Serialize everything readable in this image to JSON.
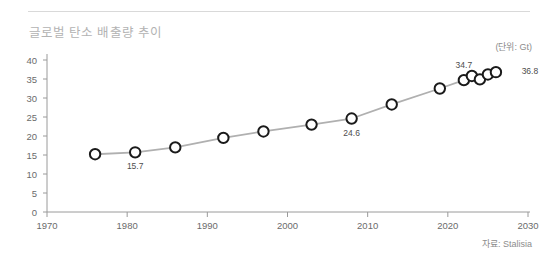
{
  "card": {
    "title": "글로벌 탄소 배출량 추이",
    "unit": "(단위: Gt)",
    "source": "자료: Stalisia"
  },
  "chart_data": {
    "type": "line",
    "title": "글로벌 탄소 배출량 추이",
    "subtitle": "",
    "xlabel": "",
    "ylabel": "",
    "unit": "(단위: Gt)",
    "source": "자료: Stalisia",
    "xlim": [
      1970,
      2030
    ],
    "ylim": [
      0,
      40
    ],
    "xticks": [
      1970,
      1980,
      1990,
      2000,
      2010,
      2020,
      2030
    ],
    "xtick_labels": [
      "1970",
      "1980",
      "1990",
      "2000",
      "2010",
      "2020",
      "2030"
    ],
    "yticks": [
      0,
      5,
      10,
      15,
      20,
      25,
      30,
      35,
      40
    ],
    "ytick_labels": [
      "0",
      "5",
      "10",
      "15",
      "20",
      "25",
      "30",
      "35",
      "40"
    ],
    "grid": false,
    "legend": false,
    "marker": "open-circle",
    "line_color": "#b0b0b0",
    "marker_edge_color": "#1a1a1a",
    "marker_face_color": "#ffffff",
    "x": [
      1976,
      1981,
      1986,
      1992,
      1997,
      2003,
      2008,
      2013,
      2019,
      2022,
      2023,
      2024,
      2025,
      2026
    ],
    "values": [
      15.2,
      15.7,
      17.0,
      19.5,
      21.2,
      23.0,
      24.6,
      28.3,
      32.5,
      34.7,
      35.8,
      34.9,
      36.2,
      36.8
    ],
    "point_labels": [
      {
        "x": 1981,
        "y": 15.7,
        "text": "15.7",
        "position": "below"
      },
      {
        "x": 2008,
        "y": 24.6,
        "text": "24.6",
        "position": "below"
      },
      {
        "x": 2022,
        "y": 34.7,
        "text": "34.7",
        "position": "above"
      },
      {
        "x": 2026,
        "y": 36.8,
        "text": "36.8",
        "position": "right"
      }
    ]
  }
}
